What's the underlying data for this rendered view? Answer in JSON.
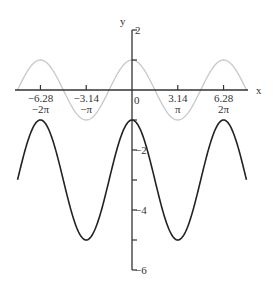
{
  "chart_data": {
    "type": "line",
    "title": "",
    "xlabel": "x",
    "ylabel": "y",
    "xlim": [
      -7.85,
      7.85
    ],
    "ylim": [
      -6,
      2
    ],
    "grid": false,
    "x_ticks": [
      {
        "value": -6.28,
        "label": "−6.28",
        "sublabel": "−2π"
      },
      {
        "value": -3.14,
        "label": "−3.14",
        "sublabel": "−π"
      },
      {
        "value": 3.14,
        "label": "3.14",
        "sublabel": "π"
      },
      {
        "value": 6.28,
        "label": "6.28",
        "sublabel": "2π"
      }
    ],
    "origin_label": "0",
    "y_ticks": [
      {
        "value": 2,
        "label": "2"
      },
      {
        "value": 1,
        "label": ""
      },
      {
        "value": -1,
        "label": ""
      },
      {
        "value": -2,
        "label": "−2"
      },
      {
        "value": -3,
        "label": ""
      },
      {
        "value": -4,
        "label": "−4"
      },
      {
        "value": -5,
        "label": ""
      },
      {
        "value": -6,
        "label": "−6"
      }
    ],
    "series": [
      {
        "name": "y = cos x",
        "expression": "cos(x)",
        "domain": [
          -7.85,
          7.85
        ],
        "color": "#c8c8c8",
        "key_points": [
          [
            -6.28,
            1
          ],
          [
            -3.14,
            -1
          ],
          [
            0,
            1
          ],
          [
            3.14,
            -1
          ],
          [
            6.28,
            1
          ]
        ]
      },
      {
        "name": "y = 2cos x − 3",
        "expression": "2*cos(x)-3",
        "domain": [
          -7.85,
          7.85
        ],
        "color": "#222222",
        "key_points": [
          [
            -7.85,
            -3
          ],
          [
            -6.28,
            -1
          ],
          [
            -3.14,
            -5
          ],
          [
            0,
            -1
          ],
          [
            3.14,
            -5
          ],
          [
            6.28,
            -1
          ],
          [
            7.85,
            -3
          ]
        ]
      }
    ]
  }
}
